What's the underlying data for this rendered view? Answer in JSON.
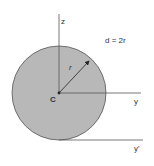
{
  "diagram": {
    "annotation": "d = 2r",
    "centroid_label": "C",
    "radius_label": "r",
    "axes": {
      "z": "z",
      "y": "y",
      "y_prime": "y'"
    },
    "colors": {
      "fill": "#b8b8b8",
      "outline": "#555555",
      "axis": "#555555",
      "arrow": "#222222",
      "text": "#333333"
    }
  }
}
